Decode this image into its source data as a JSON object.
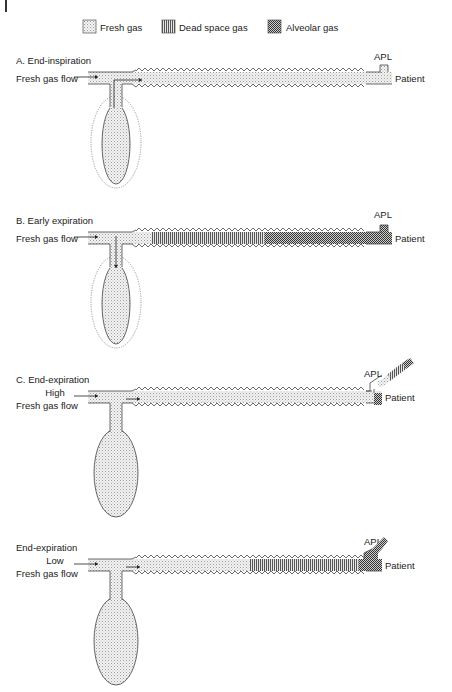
{
  "legend": {
    "items": [
      {
        "key": "fresh",
        "label": "Fresh gas",
        "pattern": "dots-light"
      },
      {
        "key": "dead",
        "label": "Dead space gas",
        "pattern": "vertical-stripes"
      },
      {
        "key": "alveolar",
        "label": "Alveolar gas",
        "pattern": "checker-dark"
      }
    ]
  },
  "panels": [
    {
      "id": "A",
      "title": "A. End-inspiration",
      "flow_label_lines": [
        "Fresh gas flow"
      ],
      "apl_label": "APL",
      "patient_label": "Patient",
      "bag_state": "collapsed-with-previous-outline",
      "tube_segments": [
        {
          "gas": "fresh",
          "from": 0.0,
          "to": 1.0
        }
      ],
      "apl_state": "closed"
    },
    {
      "id": "B",
      "title": "B. Early expiration",
      "flow_label_lines": [
        "Fresh gas flow"
      ],
      "apl_label": "APL",
      "patient_label": "Patient",
      "bag_state": "filling-with-outline",
      "tube_segments": [
        {
          "gas": "fresh",
          "from": 0.0,
          "to": 0.21
        },
        {
          "gas": "dead",
          "from": 0.21,
          "to": 0.58
        },
        {
          "gas": "alveolar",
          "from": 0.58,
          "to": 1.0
        }
      ],
      "apl_state": "closed"
    },
    {
      "id": "C",
      "title": "C. End-expiration",
      "flow_label_lines": [
        "High",
        "Fresh gas flow"
      ],
      "apl_label": "APL",
      "patient_label": "Patient",
      "bag_state": "full",
      "tube_segments": [
        {
          "gas": "fresh",
          "from": 0.0,
          "to": 1.0
        }
      ],
      "apl_state": "venting-dead-and-alveolar"
    },
    {
      "id": "D",
      "title": "End-expiration",
      "flow_label_lines": [
        "Low",
        "Fresh gas flow"
      ],
      "apl_label": "APL",
      "patient_label": "Patient",
      "bag_state": "full",
      "tube_segments": [
        {
          "gas": "fresh",
          "from": 0.0,
          "to": 0.55
        },
        {
          "gas": "dead",
          "from": 0.55,
          "to": 0.92
        },
        {
          "gas": "alveolar",
          "from": 0.92,
          "to": 1.0
        }
      ],
      "apl_state": "venting-alveolar"
    }
  ]
}
